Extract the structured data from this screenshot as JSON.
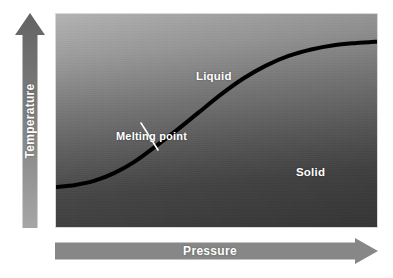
{
  "figure": {
    "width": 393,
    "height": 278,
    "background": "#ffffff"
  },
  "axes": {
    "x": {
      "label": "Pressure",
      "icon": "arrow-right-icon",
      "direction": "right",
      "color": "#878787",
      "text_color": "#ffffff"
    },
    "y": {
      "label": "Temperature",
      "icon": "arrow-up-icon",
      "direction": "up",
      "color_top": "#686868",
      "color_bottom": "#a0a0a0",
      "text_color": "#ffffff"
    }
  },
  "plot": {
    "background_top": "#b4b4b4",
    "background_bottom": "#3a3a3a",
    "border_color": "#d8d8d8"
  },
  "regions": [
    {
      "name": "liquid",
      "label": "Liquid",
      "color": "#ffffff"
    },
    {
      "name": "solid",
      "label": "Solid",
      "color": "#ffffff"
    }
  ],
  "annotations": [
    {
      "name": "melting-point",
      "label": "Melting point",
      "color": "#ffffff",
      "leader_line": {
        "from": [
          85,
          109
        ],
        "to": [
          102,
          136
        ],
        "color": "#ffffff"
      }
    }
  ],
  "chart_data": {
    "type": "line",
    "xlabel": "Pressure",
    "ylabel": "Temperature",
    "grid": false,
    "legend": "none",
    "axis_ticks": "none",
    "axis_units": "arbitrary",
    "annotations": [
      "Melting point",
      "Liquid",
      "Solid"
    ],
    "series": [
      {
        "name": "Melting curve (solid-liquid phase boundary)",
        "color": "#000000",
        "line_width": 4,
        "shape": "sigmoid",
        "description": "Melting point rises with pressure: flat at low pressure, steep through the inflection, then plateaus at high pressure.",
        "points": [
          {
            "pressure": 0.0,
            "temperature": 0.195
          },
          {
            "pressure": 0.06,
            "temperature": 0.205
          },
          {
            "pressure": 0.12,
            "temperature": 0.225
          },
          {
            "pressure": 0.18,
            "temperature": 0.26
          },
          {
            "pressure": 0.24,
            "temperature": 0.31
          },
          {
            "pressure": 0.3,
            "temperature": 0.375
          },
          {
            "pressure": 0.37,
            "temperature": 0.455
          },
          {
            "pressure": 0.44,
            "temperature": 0.54
          },
          {
            "pressure": 0.51,
            "temperature": 0.625
          },
          {
            "pressure": 0.58,
            "temperature": 0.7
          },
          {
            "pressure": 0.65,
            "temperature": 0.76
          },
          {
            "pressure": 0.72,
            "temperature": 0.805
          },
          {
            "pressure": 0.79,
            "temperature": 0.835
          },
          {
            "pressure": 0.86,
            "temperature": 0.855
          },
          {
            "pressure": 0.93,
            "temperature": 0.865
          },
          {
            "pressure": 1.0,
            "temperature": 0.872
          }
        ]
      }
    ],
    "xlim": [
      0,
      1
    ],
    "ylim": [
      0,
      1
    ],
    "region_labels": [
      {
        "label": "Liquid",
        "position": [
          0.3,
          0.74
        ],
        "note": "above the melting curve"
      },
      {
        "label": "Solid",
        "position": [
          0.62,
          0.3
        ],
        "note": "below the melting curve"
      }
    ]
  }
}
